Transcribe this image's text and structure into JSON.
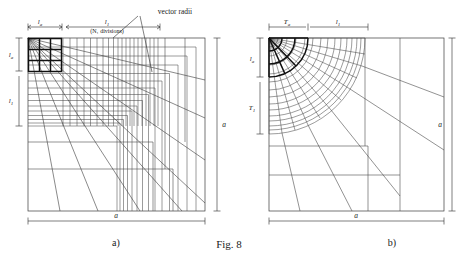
{
  "figure": {
    "caption": "Fig. 8",
    "panels": [
      {
        "id": "a",
        "caption": "a)",
        "type": "rectangular-graded-mesh",
        "annotation": "vector radii",
        "divisions_note": "(N₁ divisions)",
        "labels": {
          "top_left": "l",
          "top_left_sub": "a",
          "top_right": "l",
          "top_right_sub": "1",
          "left_upper": "l",
          "left_upper_sub": "a",
          "left_lower": "l",
          "left_lower_sub": "1",
          "right_dim": "a",
          "bottom_dim": "a"
        }
      },
      {
        "id": "b",
        "caption": "b)",
        "type": "polar-graded-mesh",
        "labels": {
          "top_left": "T",
          "top_left_sub": "a",
          "top_right": "l",
          "top_right_sub": "1",
          "left_upper": "l",
          "left_upper_sub": "a",
          "left_lower": "T",
          "left_lower_sub": "1",
          "right_dim": "a",
          "bottom_dim": "a"
        }
      }
    ]
  },
  "colors": {
    "background": "#ffffff",
    "line": "#3a3a3a",
    "bold_line": "#101010",
    "text": "#1a1a1a"
  }
}
